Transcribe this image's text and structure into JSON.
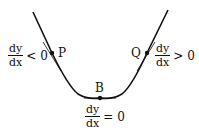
{
  "diagram": {
    "curve_color": "#111111",
    "points": {
      "P": {
        "label": "P"
      },
      "B": {
        "label": "B"
      },
      "Q": {
        "label": "Q"
      }
    },
    "annotations": {
      "left": {
        "num": "dy",
        "den": "dx",
        "rel": "< 0"
      },
      "bottom": {
        "num": "dy",
        "den": "dx",
        "rel": "= 0"
      },
      "right": {
        "num": "dy",
        "den": "dx",
        "rel": "> 0"
      }
    }
  }
}
